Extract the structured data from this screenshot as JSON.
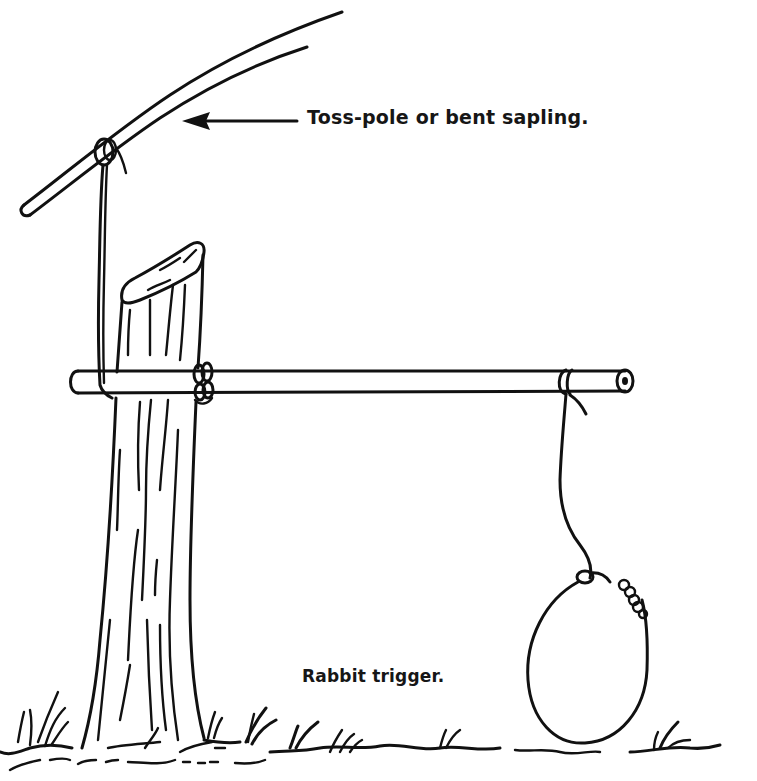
{
  "figure": {
    "type": "line illustration",
    "background_color": "#ffffff",
    "ink_color": "#111111"
  },
  "labels": {
    "toss_pole": "Toss-pole or bent sapling.",
    "caption": "Rabbit trigger."
  },
  "parts": [
    {
      "name": "toss-pole",
      "description": "bent sapling arcing from lower-left to upper-right"
    },
    {
      "name": "cord",
      "description": "twisted cord tied to toss-pole, running down to crossbar"
    },
    {
      "name": "stump",
      "description": "upright stake/stump with slanted cut top"
    },
    {
      "name": "crossbar",
      "description": "horizontal trigger bar lashed to stump"
    },
    {
      "name": "snare-line",
      "description": "line hanging from crossbar end"
    },
    {
      "name": "noose",
      "description": "wire loop snare"
    },
    {
      "name": "ground",
      "description": "ground line with grass tufts"
    }
  ],
  "arrow": {
    "from": "toss_pole label",
    "to": "toss-pole",
    "direction": "left"
  }
}
